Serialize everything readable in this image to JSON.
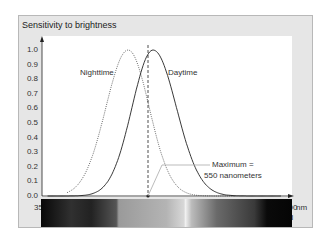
{
  "chart_data": {
    "type": "line",
    "title": "Sensitivity to brightness",
    "xlabel": "nm",
    "ylabel": "Sensitivity to brightness",
    "xlim": [
      350,
      800
    ],
    "ylim": [
      0.0,
      1.0
    ],
    "grid": false,
    "yticks": [
      "1.0",
      "0.9",
      "0.8",
      "0.7",
      "0.6",
      "0.5",
      "0.4",
      "0.3",
      "0.2",
      "0.1",
      "0.0"
    ],
    "xticks": [
      "350",
      "450",
      "550",
      "650",
      "750",
      "800"
    ],
    "x_unit": "nm",
    "color_names": [
      "violet",
      "blue",
      "green",
      "yellow",
      "orange",
      "red",
      "infrared"
    ],
    "series": [
      {
        "name": "Nighttime",
        "style": "dotted",
        "x": [
          400,
          425,
          450,
          475,
          500,
          505,
          525,
          550,
          575,
          600,
          625,
          650
        ],
        "values": [
          0.0,
          0.15,
          0.45,
          0.8,
          1.0,
          1.0,
          0.85,
          0.45,
          0.15,
          0.05,
          0.01,
          0.0
        ]
      },
      {
        "name": "Daytime",
        "style": "solid",
        "x": [
          400,
          450,
          475,
          500,
          525,
          550,
          575,
          600,
          625,
          650,
          700,
          750
        ],
        "values": [
          0.0,
          0.04,
          0.15,
          0.45,
          0.85,
          1.0,
          0.85,
          0.5,
          0.2,
          0.06,
          0.01,
          0.0
        ]
      }
    ],
    "annotations": [
      {
        "text": "Nighttime",
        "target": "Nighttime curve"
      },
      {
        "text": "Daytime",
        "target": "Daytime curve"
      },
      {
        "text": "Maximum = 550 nanometers",
        "x": 550,
        "style": "dashed vertical line"
      }
    ]
  },
  "labels": {
    "title": "Sensitivity to brightness",
    "night": "Nighttime",
    "day": "Daytime",
    "max_line1": "Maximum =",
    "max_line2": "550 nanometers",
    "unit": "nm"
  }
}
